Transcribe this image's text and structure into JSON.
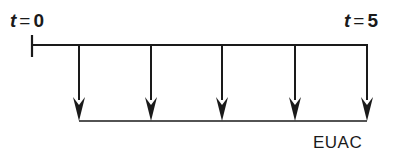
{
  "diagram": {
    "type": "cash-flow-diagram",
    "start_label": {
      "var": "t",
      "eq": "=",
      "value": "0"
    },
    "end_label": {
      "var": "t",
      "eq": "=",
      "value": "5"
    },
    "series_label": "EUAC",
    "periods": [
      1,
      2,
      3,
      4,
      5
    ],
    "flow_direction": "down",
    "colors": {
      "stroke": "#1a1a1a",
      "background": "#ffffff"
    }
  }
}
